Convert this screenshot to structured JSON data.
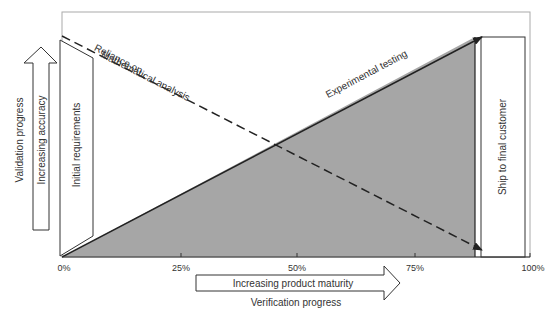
{
  "diagram": {
    "x_axis": {
      "ticks": [
        "0%",
        "25%",
        "50%",
        "75%",
        "100%"
      ],
      "arrow_label": "Increasing product maturity",
      "title": "Verification progress"
    },
    "y_axis": {
      "title": "Validation progress",
      "arrow_label": "Increasing accuracy"
    },
    "boxes": {
      "initial": "Initial requirements",
      "ship": "Ship to final customer"
    },
    "lines": {
      "dashed": [
        "Reliance on",
        "Mathematical analysis"
      ],
      "solid": "Experimental testing"
    },
    "colors": {
      "fill": "#a6a6a6",
      "line": "#222222",
      "frame": "#aaaaaa"
    }
  }
}
